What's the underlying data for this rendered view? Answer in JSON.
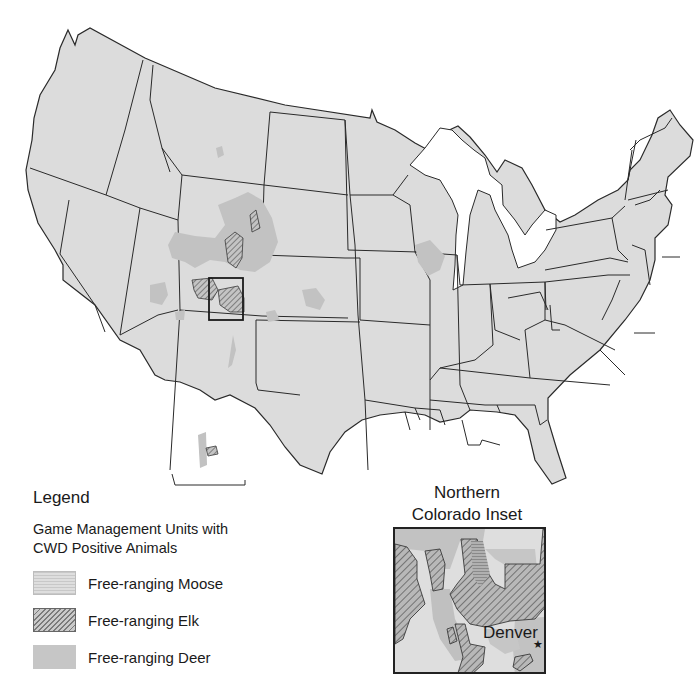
{
  "map": {
    "subject": "Game Management Units with CWD Positive Animals - contiguous United States",
    "colors": {
      "land": "#dcdcdc",
      "water": "#ffffff",
      "border": "#2a2a2a",
      "deer": "#c2c2c2",
      "elk_hatch": "#6e6e6e",
      "moose": "#d2d2d2"
    },
    "highlight_box": "Northern Colorado"
  },
  "legend": {
    "title": "Legend",
    "subtitle_line1": "Game Management Units with",
    "subtitle_line2": "CWD Positive Animals",
    "items": [
      {
        "label": "Free-ranging Moose",
        "pattern": "fine-horizontal-stipple"
      },
      {
        "label": "Free-ranging Elk",
        "pattern": "diagonal-hatch"
      },
      {
        "label": "Free-ranging Deer",
        "pattern": "solid-gray"
      }
    ]
  },
  "inset": {
    "title_line1": "Northern",
    "title_line2": "Colorado Inset",
    "city": "Denver",
    "city_marker": "★"
  }
}
